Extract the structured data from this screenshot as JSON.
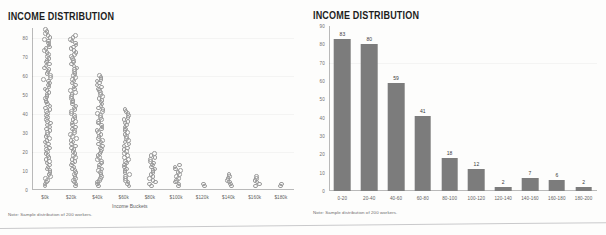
{
  "page": {
    "background": "#fdfdfc",
    "bar_color": "#7c7c7c",
    "dot_outline_color": "#9b9b9b",
    "axis_color": "#b9b9b9",
    "title_color": "#1d1d1d"
  },
  "left_panel": {
    "title": "INCOME DISTRIBUTION",
    "note": "Note: Sample distribution of 200 workers.",
    "xlabel": "Income Buckets"
  },
  "right_panel": {
    "title": "INCOME DISTRIBUTION",
    "note": "Note: Sample distribution of 200 workers."
  },
  "chart_data": [
    {
      "type": "scatter",
      "title": "INCOME DISTRIBUTION",
      "subtitle": "",
      "xlabel": "Income Buckets",
      "ylabel": "",
      "grid": false,
      "legend": "none",
      "note": "Note: Sample distribution of 200 workers.",
      "categories": [
        "$0k",
        "$20k",
        "$40k",
        "$60k",
        "$80k",
        "$100k",
        "$120k",
        "$140k",
        "$160k",
        "$180k"
      ],
      "values": [
        83,
        80,
        59,
        41,
        18,
        12,
        2,
        7,
        6,
        2
      ],
      "ylim": [
        0,
        85
      ],
      "yticks": [
        0,
        10,
        20,
        30,
        40,
        50,
        60,
        70,
        80
      ],
      "xtick_labels": [
        "$0k",
        "$20k",
        "$40k",
        "$60k",
        "$80k",
        "$100k",
        "$120k",
        "$140k",
        "$160k",
        "$180k"
      ],
      "marker": "open-circle",
      "description": "Strip plot: one small open circle stacked per worker in each income bucket."
    },
    {
      "type": "bar",
      "title": "INCOME DISTRIBUTION",
      "subtitle": "",
      "xlabel": "",
      "ylabel": "",
      "grid": false,
      "legend": "none",
      "note": "Note: Sample distribution of 200 workers.",
      "categories": [
        "0-20",
        "20-40",
        "40-60",
        "60-80",
        "80-100",
        "100-120",
        "120-140",
        "140-160",
        "160-180",
        "180-200"
      ],
      "values": [
        83,
        80,
        59,
        41,
        18,
        12,
        2,
        7,
        6,
        2
      ],
      "data_labels": [
        "83",
        "80",
        "59",
        "41",
        "18",
        "12",
        "2",
        "7",
        "6",
        "2"
      ],
      "ylim": [
        0,
        90
      ],
      "yticks": [
        0,
        10,
        20,
        30,
        40,
        50,
        60,
        70,
        80,
        90
      ],
      "xtick_labels": [
        "0-20",
        "20-40",
        "40-60",
        "60-80",
        "80-100",
        "100-120",
        "120-140",
        "140-160",
        "160-180",
        "180-200"
      ]
    }
  ]
}
